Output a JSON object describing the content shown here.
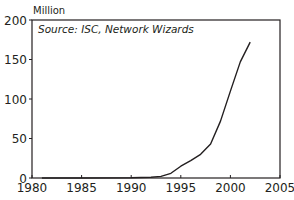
{
  "chart_data": {
    "type": "line",
    "title": "",
    "unit_label": "Million",
    "annotation": "Source: ISC, Network Wizards",
    "xlabel": "",
    "ylabel": "Million",
    "xlim": [
      1980,
      2005
    ],
    "ylim": [
      0,
      200
    ],
    "x_ticks": [
      1980,
      1985,
      1990,
      1995,
      2000,
      2005
    ],
    "y_ticks": [
      0,
      50,
      100,
      150,
      200
    ],
    "grid": false,
    "legend": null,
    "series": [
      {
        "name": "Internet hosts",
        "color": "#231f20",
        "x": [
          1981,
          1985,
          1990,
          1991,
          1992,
          1993,
          1994,
          1995,
          1996,
          1997,
          1998,
          1999,
          2000,
          2001,
          2002
        ],
        "values": [
          0,
          0,
          0.3,
          0.6,
          1,
          2,
          6,
          15,
          22,
          30,
          43,
          72,
          110,
          147,
          172
        ]
      }
    ]
  }
}
